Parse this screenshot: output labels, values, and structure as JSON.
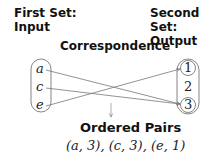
{
  "first_set": {
    "title_line1": "First Set:",
    "title_line2": "Input",
    "elements": [
      "a",
      "c",
      "e"
    ]
  },
  "second_set": {
    "title_line1": "Second Set:",
    "title_line2": "Output",
    "elements": [
      "1",
      "2",
      "3"
    ],
    "circled": [
      "1",
      "3"
    ]
  },
  "correspondence_label": "Correspondence",
  "mappings": [
    {
      "from": "a",
      "to": "3"
    },
    {
      "from": "c",
      "to": "3"
    },
    {
      "from": "e",
      "to": "1"
    }
  ],
  "ordered_pairs": {
    "title": "Ordered Pairs",
    "text": "(a, 3), (c, 3), (e, 1)"
  }
}
